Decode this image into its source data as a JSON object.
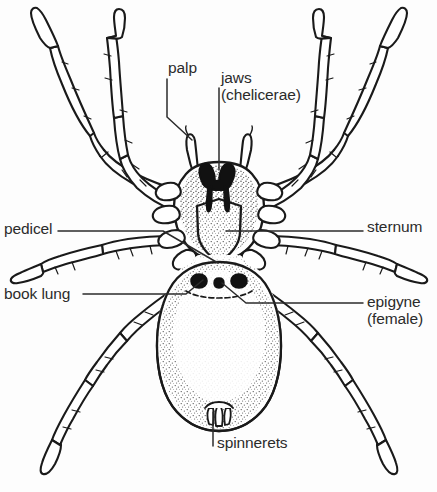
{
  "figure": {
    "background_color": "#fdfdfd",
    "ink_color": "#1a1a1a",
    "text_color": "#2b2b2b"
  },
  "labels": {
    "palp": "palp",
    "jaws": "jaws",
    "jaws_second_line": "(chelicerae)",
    "pedicel": "pedicel",
    "sternum": "sternum",
    "book_lung": "book lung",
    "epigyne": "epigyne",
    "epigyne_second_line": "(female)",
    "spinnerets": "spinnerets"
  }
}
